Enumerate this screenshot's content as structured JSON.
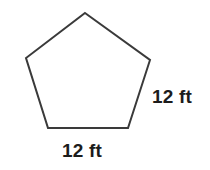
{
  "figure": {
    "name": "regular-pentagon-diagram",
    "shape": "pentagon",
    "background_color": "#ffffff",
    "stroke_color": "#3a3a3a",
    "fill_color": "#ffffff",
    "stroke_width": 2,
    "vertices": [
      {
        "name": "apex",
        "x": 85,
        "y": 13
      },
      {
        "name": "upper-right",
        "x": 150,
        "y": 60
      },
      {
        "name": "lower-right",
        "x": 128,
        "y": 128
      },
      {
        "name": "lower-left",
        "x": 48,
        "y": 128
      },
      {
        "name": "upper-left",
        "x": 26,
        "y": 58
      }
    ],
    "points_attr": "85,13 150,60 128,128 48,128 26,58"
  },
  "labels": {
    "right_side": {
      "text": "12 ft",
      "value": "12",
      "unit": "ft",
      "color": "#1c1c1c"
    },
    "bottom_side": {
      "text": "12 ft",
      "value": "12",
      "unit": "ft",
      "color": "#1c1c1c"
    }
  }
}
